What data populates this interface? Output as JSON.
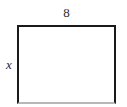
{
  "figure": {
    "type": "rectangle-diagram",
    "shape_name": "rectangle",
    "background_color": "#ffffff",
    "stroke_color": "#1a1a1a",
    "fill_color": "#ffffff",
    "labels": {
      "top_side": "8",
      "left_side": "x"
    }
  },
  "chart_data": {
    "type": "diagram",
    "title": "",
    "shape": "rectangle",
    "annotations": [
      {
        "name": "top-side-length",
        "text": "8",
        "position": "top",
        "style": "upright"
      },
      {
        "name": "left-side-length",
        "text": "x",
        "position": "left",
        "style": "italic"
      }
    ]
  }
}
